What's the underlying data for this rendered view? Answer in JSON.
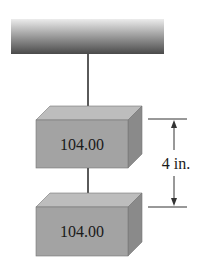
{
  "diagram": {
    "top_block": {
      "label": "104.00"
    },
    "bottom_block": {
      "label": "104.00"
    },
    "dimension": {
      "label": "4 in."
    },
    "colors": {
      "ceiling_top": "#e8e8e8",
      "ceiling_bottom": "#4a4a4a",
      "block_front": "#a3a3a3",
      "block_top": "#bdbdbd",
      "block_side": "#8a8a8a",
      "string": "#5a5a5a",
      "line": "#333333"
    }
  }
}
